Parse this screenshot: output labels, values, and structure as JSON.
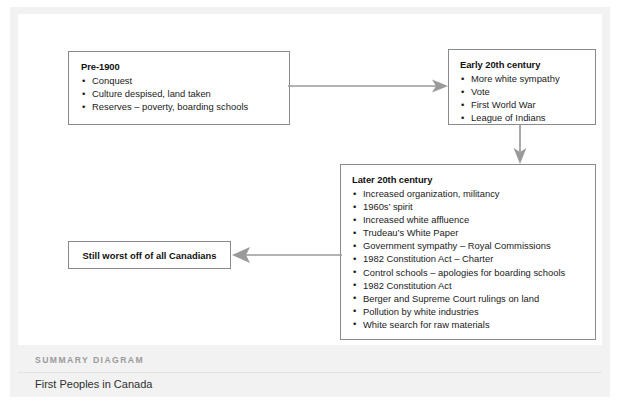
{
  "diagram": {
    "nodes": [
      {
        "id": "pre-1900",
        "title": "Pre-1900",
        "bullets": [
          "Conquest",
          "Culture despised, land taken",
          "Reserves – poverty, boarding schools"
        ]
      },
      {
        "id": "early-20th-century",
        "title": "Early 20th century",
        "bullets": [
          "More white sympathy",
          "Vote",
          "First World War",
          "League of Indians"
        ]
      },
      {
        "id": "later-20th-century",
        "title": "Later 20th century",
        "bullets": [
          "Increased organization, militancy",
          "1960s’ spirit",
          "Increased white affluence",
          "Trudeau’s White Paper",
          "Government sympathy – Royal Commissions",
          "1982 Constitution Act – Charter",
          "Control schools – apologies for boarding schools",
          "1982 Constitution Act",
          "Berger and Supreme Court rulings on land",
          "Pollution by white industries",
          "White search for raw materials"
        ]
      }
    ],
    "conclusion": {
      "text": "Still worst off of all Canadians"
    },
    "connectors": [
      {
        "id": "pre-1900-to-early-20th-century",
        "direction": "right"
      },
      {
        "id": "early-20th-century-to-later-20th-century",
        "direction": "down"
      },
      {
        "id": "later-20th-century-to-conclusion",
        "direction": "left"
      }
    ]
  },
  "footer": {
    "kicker": "SUMMARY DIAGRAM",
    "title": "First Peoples in Canada"
  },
  "colors": {
    "box_border": "#8a8a8a",
    "arrow": "#9a9a9a",
    "page_background": "#f2f2f2",
    "card_background": "#ffffff",
    "text": "#1a1a1a",
    "kicker_text": "#9a9a9a"
  }
}
